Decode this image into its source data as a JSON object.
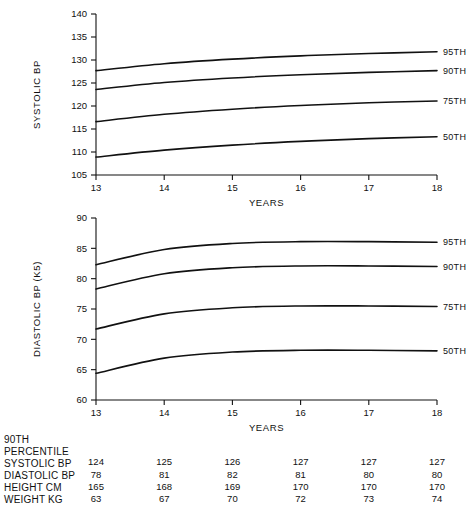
{
  "chart_data": [
    {
      "type": "line",
      "name": "systolic-chart",
      "title": "",
      "xlabel": "YEARS",
      "ylabel": "SYSTOLIC BP",
      "x": [
        13,
        14,
        15,
        16,
        17,
        18
      ],
      "xlim": [
        13,
        18
      ],
      "ylim": [
        105,
        140
      ],
      "xticks": [
        13,
        14,
        15,
        16,
        17,
        18
      ],
      "yticks": [
        105,
        110,
        115,
        120,
        125,
        130,
        135,
        140
      ],
      "grid": false,
      "legend_position": "right-of-line-ends",
      "series": [
        {
          "name": "95TH",
          "values": [
            127.7,
            129.2,
            130.2,
            130.9,
            131.4,
            131.8
          ]
        },
        {
          "name": "90TH",
          "values": [
            123.6,
            125.1,
            126.1,
            126.8,
            127.3,
            127.7
          ]
        },
        {
          "name": "75TH",
          "values": [
            116.6,
            118.2,
            119.3,
            120.1,
            120.7,
            121.1
          ]
        },
        {
          "name": "50TH",
          "values": [
            108.9,
            110.4,
            111.5,
            112.3,
            112.9,
            113.3
          ]
        }
      ]
    },
    {
      "type": "line",
      "name": "diastolic-chart",
      "title": "",
      "xlabel": "YEARS",
      "ylabel": "DIASTOLIC BP (K5)",
      "x": [
        13,
        14,
        15,
        16,
        17,
        18
      ],
      "xlim": [
        13,
        18
      ],
      "ylim": [
        60,
        90
      ],
      "xticks": [
        13,
        14,
        15,
        16,
        17,
        18
      ],
      "yticks": [
        60,
        65,
        70,
        75,
        80,
        85,
        90
      ],
      "grid": false,
      "legend_position": "right-of-line-ends",
      "series": [
        {
          "name": "95TH",
          "values": [
            82.3,
            84.8,
            85.8,
            86.1,
            86.1,
            86.0
          ]
        },
        {
          "name": "90TH",
          "values": [
            78.3,
            80.8,
            81.8,
            82.1,
            82.1,
            82.0
          ]
        },
        {
          "name": "75TH",
          "values": [
            71.7,
            74.2,
            75.2,
            75.5,
            75.5,
            75.4
          ]
        },
        {
          "name": "50TH",
          "values": [
            64.4,
            66.9,
            67.9,
            68.2,
            68.2,
            68.1
          ]
        }
      ]
    }
  ],
  "systolic": {
    "ylabel": "SYSTOLIC BP",
    "xlabel": "YEARS",
    "ytick_labels": [
      "140",
      "135",
      "130",
      "125",
      "120",
      "115",
      "110",
      "105"
    ],
    "xtick_labels": [
      "13",
      "14",
      "15",
      "16",
      "17",
      "18"
    ],
    "percentile_labels": [
      "95TH",
      "90TH",
      "75TH",
      "50TH"
    ]
  },
  "diastolic": {
    "ylabel": "DIASTOLIC BP (K5)",
    "xlabel": "YEARS",
    "ytick_labels": [
      "90",
      "85",
      "80",
      "75",
      "70",
      "65",
      "60"
    ],
    "xtick_labels": [
      "13",
      "14",
      "15",
      "16",
      "17",
      "18"
    ],
    "percentile_labels": [
      "95TH",
      "90TH",
      "75TH",
      "50TH"
    ]
  },
  "table": {
    "header_line1": "90TH",
    "header_line2": "PERCENTILE",
    "row_labels": [
      "SYSTOLIC BP",
      "DIASTOLIC BP",
      "HEIGHT CM",
      "WEIGHT KG"
    ],
    "rows": [
      {
        "label": "SYSTOLIC BP",
        "values": [
          "124",
          "125",
          "126",
          "127",
          "127",
          "127"
        ]
      },
      {
        "label": "DIASTOLIC BP",
        "values": [
          "78",
          "81",
          "82",
          "81",
          "80",
          "80"
        ]
      },
      {
        "label": "HEIGHT CM",
        "values": [
          "165",
          "168",
          "169",
          "170",
          "170",
          "170"
        ]
      },
      {
        "label": "WEIGHT KG",
        "values": [
          "63",
          "67",
          "70",
          "72",
          "73",
          "74"
        ]
      }
    ]
  },
  "colors": {
    "ink": "#111111",
    "background": "#ffffff"
  }
}
